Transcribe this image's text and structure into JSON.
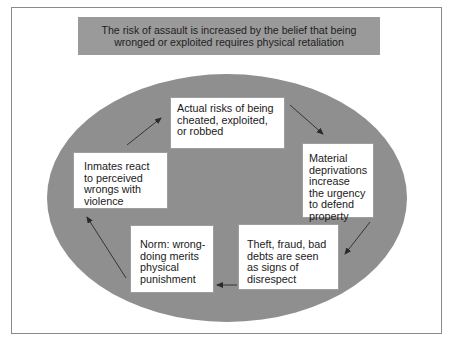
{
  "header": {
    "text": "The risk of assault is increased by the belief that being wronged or exploited requires physical retaliation"
  },
  "cycle": {
    "nodes": [
      {
        "id": "top",
        "text": "Actual risks of being cheated, exploited, or robbed"
      },
      {
        "id": "right",
        "text": "Material deprivations increase the urgency to defend property"
      },
      {
        "id": "bottom-right",
        "text": "Theft, fraud, bad debts are seen as signs of disrespect"
      },
      {
        "id": "bottom-left",
        "text": "Norm: wrong-doing merits physical punishment"
      },
      {
        "id": "left",
        "text": "Inmates react to perceived wrongs with violence"
      }
    ],
    "arrows": [
      {
        "from": "top",
        "to": "right"
      },
      {
        "from": "right",
        "to": "bottom-right"
      },
      {
        "from": "bottom-right",
        "to": "bottom-left"
      },
      {
        "from": "bottom-left",
        "to": "left"
      },
      {
        "from": "left",
        "to": "top"
      }
    ]
  },
  "colors": {
    "header_fill": "#9a9a9a",
    "ellipse_fill": "#8f8f8f",
    "node_fill": "#ffffff",
    "arrow": "#2a2a2a",
    "frame_border": "#8a8a8a"
  }
}
